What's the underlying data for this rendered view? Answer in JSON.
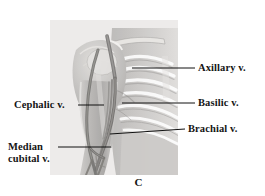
{
  "figure": {
    "panel_letter": "C",
    "background_color": "#ffffff",
    "panel_background_color": "#ededec",
    "line_color": "#111111",
    "text_color": "#141414"
  },
  "labels": [
    {
      "id": "axillary",
      "text": "Axillary v.",
      "side": "right",
      "text_x": 198,
      "text_y": 62,
      "leader": {
        "x1": 132,
        "y1": 68,
        "x2": 195,
        "y2": 68
      }
    },
    {
      "id": "basilic",
      "text": "Basilic v.",
      "side": "right",
      "text_x": 198,
      "text_y": 97,
      "leader": {
        "x1": 122,
        "y1": 103,
        "x2": 195,
        "y2": 103
      }
    },
    {
      "id": "brachial",
      "text": "Brachial v.",
      "side": "right",
      "text_x": 188,
      "text_y": 123,
      "leader": {
        "x1": 110,
        "y1": 134,
        "x2": 185,
        "y2": 129
      }
    },
    {
      "id": "cephalic",
      "text": "Cephalic v.",
      "side": "left",
      "text_x": 14,
      "text_y": 99,
      "leader": {
        "x1": 78,
        "y1": 105,
        "x2": 104,
        "y2": 105
      }
    },
    {
      "id": "median-cubital",
      "text": "Median cubital v.",
      "side": "left",
      "text_x": 8,
      "text_y": 141,
      "leader": {
        "x1": 58,
        "y1": 147,
        "x2": 111,
        "y2": 147
      }
    }
  ]
}
